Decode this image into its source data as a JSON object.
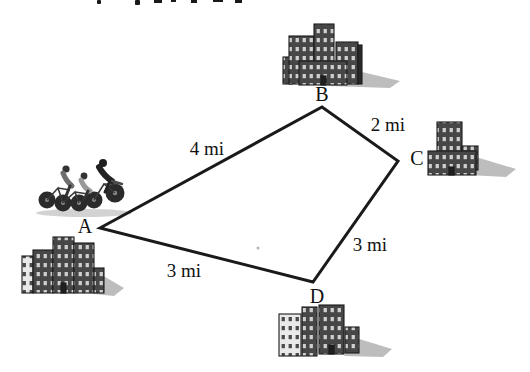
{
  "diagram": {
    "vertices": [
      {
        "id": "A",
        "label": "A"
      },
      {
        "id": "B",
        "label": "B"
      },
      {
        "id": "C",
        "label": "C"
      },
      {
        "id": "D",
        "label": "D"
      }
    ],
    "edges": [
      {
        "from": "A",
        "to": "B",
        "label": "4 mi"
      },
      {
        "from": "B",
        "to": "C",
        "label": "2 mi"
      },
      {
        "from": "C",
        "to": "D",
        "label": "3 mi"
      },
      {
        "from": "D",
        "to": "A",
        "label": "3 mi"
      }
    ],
    "colors": {
      "line": "#1a1a1a",
      "text": "#111111",
      "background": "#ffffff",
      "building_dark": "#474747",
      "building_light": "#e9e9e9",
      "shadow": "#9a9a9a"
    }
  },
  "illustrations": {
    "city_b": "building-cluster-at-B",
    "city_c": "building-cluster-at-C",
    "city_d": "building-cluster-at-D",
    "city_a": "building-cluster-at-A",
    "cyclists": "three-cyclists-riding-near-A",
    "top_edge": "cut-off-text-fragments"
  }
}
